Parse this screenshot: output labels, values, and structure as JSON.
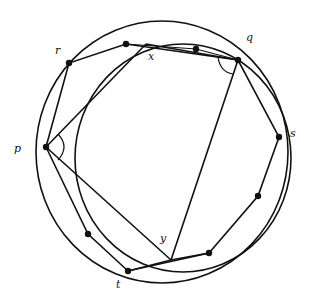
{
  "diagram": {
    "type": "geometry",
    "outer_circle": {
      "cx": 162,
      "cy": 152,
      "rx": 126,
      "ry": 131
    },
    "inner_circle": {
      "cx": 183,
      "cy": 158,
      "rx": 108,
      "ry": 114
    },
    "labels": [
      {
        "id": "r",
        "text": "r",
        "x": 55,
        "y": 54
      },
      {
        "id": "x",
        "text": "x",
        "x": 148,
        "y": 60
      },
      {
        "id": "q",
        "text": "q",
        "x": 246,
        "y": 41
      },
      {
        "id": "p",
        "text": "p",
        "x": 14,
        "y": 152
      },
      {
        "id": "s",
        "text": "s",
        "x": 290,
        "y": 137
      },
      {
        "id": "y",
        "text": "y",
        "x": 160,
        "y": 242
      },
      {
        "id": "t",
        "text": "t",
        "x": 116,
        "y": 288
      }
    ],
    "points": {
      "p": [
        46,
        147
      ],
      "r": [
        69,
        63
      ],
      "x": [
        146,
        44
      ],
      "q": [
        238,
        60
      ],
      "s": [
        279,
        137
      ],
      "y": [
        171,
        260
      ],
      "t": [
        128,
        271
      ]
    },
    "dots": [
      {
        "name": "r",
        "x": 69,
        "y": 63
      },
      {
        "name": "rx-mid",
        "x": 126,
        "y": 44
      },
      {
        "name": "xq-mid",
        "x": 196,
        "y": 49
      },
      {
        "name": "q",
        "x": 238,
        "y": 60
      },
      {
        "name": "s",
        "x": 279,
        "y": 137
      },
      {
        "name": "sy-mid",
        "x": 258,
        "y": 196
      },
      {
        "name": "y-right",
        "x": 209,
        "y": 253
      },
      {
        "name": "pt-mid",
        "x": 88,
        "y": 234
      },
      {
        "name": "t",
        "x": 128,
        "y": 271
      },
      {
        "name": "p",
        "x": 46,
        "y": 147
      }
    ],
    "angle_marks": [
      "p",
      "q"
    ]
  }
}
